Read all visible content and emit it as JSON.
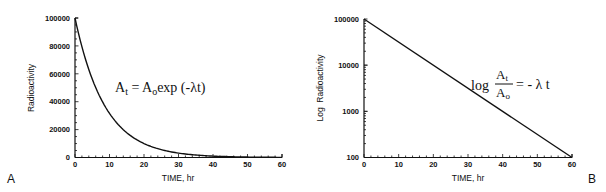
{
  "chart_data": [
    {
      "panel": "A",
      "type": "line",
      "title": "",
      "xlabel": "TIME, hr",
      "ylabel": "Radioactivity",
      "xlim": [
        0,
        60
      ],
      "ylim": [
        0,
        100000
      ],
      "x_ticks": [
        "0",
        "10",
        "20",
        "30",
        "40",
        "50",
        "60"
      ],
      "y_ticks": [
        "0",
        "20000",
        "40000",
        "60000",
        "80000",
        "100000"
      ],
      "grid": false,
      "annotation": "At = Aoexp (-λt)",
      "series": [
        {
          "name": "Radioactivity",
          "x": [
            0,
            5,
            10,
            15,
            20,
            25,
            30,
            35,
            40,
            45,
            50,
            55,
            60
          ],
          "values": [
            100000,
            56230,
            31620,
            17780,
            10000,
            5620,
            3160,
            1780,
            1000,
            560,
            316,
            178,
            100
          ]
        }
      ]
    },
    {
      "panel": "B",
      "type": "line",
      "title": "",
      "xlabel": "TIME, hr",
      "ylabel": "Log  Radioactivity",
      "xlim": [
        0,
        60
      ],
      "ylim": [
        100,
        100000
      ],
      "yscale": "log",
      "x_ticks": [
        "0",
        "10",
        "20",
        "30",
        "40",
        "50",
        "60"
      ],
      "y_ticks": [
        "100",
        "1000",
        "10000",
        "100000"
      ],
      "grid": false,
      "annotation": "log At/Ao = - λ t",
      "series": [
        {
          "name": "Log Radioactivity",
          "x": [
            0,
            10,
            20,
            30,
            40,
            50,
            60
          ],
          "values": [
            100000,
            31620,
            10000,
            3160,
            1000,
            316,
            100
          ]
        }
      ]
    }
  ],
  "panelA": {
    "letter": "A",
    "xlabel": "TIME, hr",
    "ylabel": "Radioactivity",
    "x_ticks": [
      "0",
      "10",
      "20",
      "30",
      "40",
      "50",
      "60"
    ],
    "y_ticks": [
      "0",
      "20000",
      "40000",
      "60000",
      "80000",
      "100000"
    ],
    "eq": {
      "A": "A",
      "t": "t",
      "eqA0": " = A",
      "o": "o",
      "rest": "exp (-λt)"
    }
  },
  "panelB": {
    "letter": "B",
    "xlabel": "TIME, hr",
    "ylabel": "Log  Radioactivity",
    "x_ticks": [
      "0",
      "10",
      "20",
      "30",
      "40",
      "50",
      "60"
    ],
    "y_ticks": [
      "100",
      "1000",
      "10000",
      "100000"
    ],
    "eq": {
      "log": "log",
      "num": "A",
      "numsub": "t",
      "den": "A",
      "densub": "o",
      "rhs": "= - λ t"
    }
  }
}
